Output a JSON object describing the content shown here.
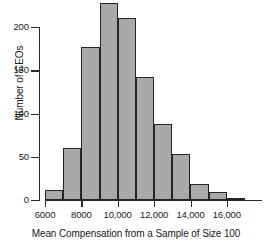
{
  "chart_data": {
    "type": "bar",
    "title": "",
    "subtitle": "",
    "xlabel": "Mean Compensation from a Sample of Size 100",
    "ylabel": "Number of CEOs",
    "grid": false,
    "legend": null,
    "bin_width": 1000,
    "xlim": [
      6000,
      17000
    ],
    "ylim": [
      0,
      200
    ],
    "x_tick_labels": [
      "6000",
      "8000",
      "10,000",
      "12,000",
      "14,000",
      "16,000"
    ],
    "x_tick_values": [
      6000,
      8000,
      10000,
      12000,
      14000,
      16000
    ],
    "y_tick_labels": [
      "0",
      "50",
      "100",
      "150",
      "200"
    ],
    "y_tick_values": [
      0,
      50,
      100,
      150,
      200
    ],
    "bin_edges": [
      6000,
      7000,
      8000,
      9000,
      10000,
      11000,
      12000,
      13000,
      14000,
      15000,
      16000,
      17000
    ],
    "categories": [
      "6000-7000",
      "7000-8000",
      "8000-9000",
      "9000-10,000",
      "10,000-11,000",
      "11,000-12,000",
      "12,000-13,000",
      "13,000-14,000",
      "14,000-15,000",
      "15,000-16,000",
      "16,000-17,000"
    ],
    "values": [
      12,
      60,
      177,
      228,
      211,
      142,
      88,
      53,
      18,
      9,
      1
    ],
    "bar_fill_color": "#a9a9a9",
    "bar_edge_color": "#252525",
    "axis_color": "#2a2a2a"
  }
}
